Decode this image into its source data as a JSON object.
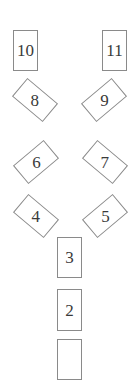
{
  "diagram": {
    "title": "",
    "line_color": "#8a8a8a",
    "text_color": "#3a3a3a",
    "nodes": [
      {
        "id": "10",
        "label": "10",
        "shape": "rectangle",
        "column": "left",
        "row": 1
      },
      {
        "id": "11",
        "label": "11",
        "shape": "rectangle",
        "column": "right",
        "row": 1
      },
      {
        "id": "8",
        "label": "8",
        "shape": "tilted-rectangle",
        "column": "left",
        "row": 2
      },
      {
        "id": "9",
        "label": "9",
        "shape": "tilted-rectangle",
        "column": "right",
        "row": 2
      },
      {
        "id": "6",
        "label": "6",
        "shape": "tilted-rectangle",
        "column": "left",
        "row": 3
      },
      {
        "id": "7",
        "label": "7",
        "shape": "tilted-rectangle",
        "column": "right",
        "row": 3
      },
      {
        "id": "4",
        "label": "4",
        "shape": "tilted-rectangle",
        "column": "left",
        "row": 4
      },
      {
        "id": "5",
        "label": "5",
        "shape": "tilted-rectangle",
        "column": "right",
        "row": 4
      },
      {
        "id": "3",
        "label": "3",
        "shape": "rectangle",
        "column": "center",
        "row": 5
      },
      {
        "id": "2",
        "label": "2",
        "shape": "rectangle",
        "column": "center",
        "row": 6
      },
      {
        "id": "1",
        "label": "",
        "shape": "rectangle",
        "column": "center",
        "row": 7,
        "partially_visible": true
      }
    ]
  }
}
